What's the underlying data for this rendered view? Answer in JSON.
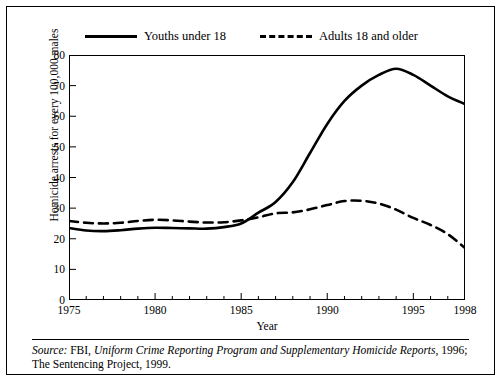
{
  "chart_data": {
    "type": "line",
    "title": "",
    "xlabel": "Year",
    "ylabel": "Homicide arrests for every 100,000 males",
    "xlim": [
      1975,
      1998
    ],
    "ylim": [
      0,
      80
    ],
    "grid": false,
    "legend_position": "top-center",
    "xticks": [
      1975,
      1980,
      1985,
      1990,
      1995,
      1998
    ],
    "xtick_labels": [
      "1975",
      "1980",
      "1985",
      "1990",
      "1995",
      "1998"
    ],
    "yticks": [
      0,
      10,
      20,
      30,
      40,
      50,
      60,
      70,
      80
    ],
    "ytick_labels": [
      "0",
      "10",
      "20",
      "30",
      "40",
      "50",
      "60",
      "70",
      "80"
    ],
    "x": [
      1975,
      1976,
      1977,
      1978,
      1979,
      1980,
      1981,
      1982,
      1983,
      1984,
      1985,
      1986,
      1987,
      1988,
      1989,
      1990,
      1991,
      1992,
      1993,
      1994,
      1995,
      1996,
      1997,
      1998
    ],
    "series": [
      {
        "name": "Youths under 18",
        "style": "solid",
        "color": "#000000",
        "values": [
          23.5,
          22.7,
          22.5,
          22.8,
          23.3,
          23.6,
          23.5,
          23.4,
          23.3,
          23.8,
          25.0,
          28.5,
          32.0,
          38.5,
          48.0,
          57.5,
          65.0,
          70.0,
          73.5,
          75.5,
          73.5,
          70.0,
          66.5,
          64.0
        ]
      },
      {
        "name": "Adults 18 and older",
        "style": "dashed",
        "color": "#000000",
        "values": [
          25.8,
          25.2,
          25.0,
          25.2,
          25.8,
          26.2,
          26.0,
          25.6,
          25.3,
          25.4,
          26.0,
          27.0,
          28.3,
          28.6,
          29.6,
          31.0,
          32.3,
          32.4,
          31.5,
          29.5,
          26.8,
          24.5,
          21.5,
          17.0
        ]
      }
    ],
    "legend": [
      {
        "label": "Youths under 18",
        "style": "solid"
      },
      {
        "label": "Adults 18 and older",
        "style": "dashed"
      }
    ]
  },
  "source": {
    "prefix": "Source:",
    "text_1": " FBI, ",
    "italic_1": "Uniform Crime Reporting Program and Supplementary Homicide Reports",
    "text_2": ", 1996; The Sentencing Project, 1999."
  }
}
